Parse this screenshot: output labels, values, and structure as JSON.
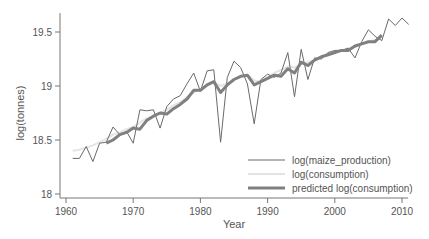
{
  "chart_data": {
    "type": "line",
    "title": "",
    "xlabel": "Year",
    "ylabel": "log(tonnes)",
    "xlim": [
      1959,
      2012
    ],
    "ylim": [
      17.93,
      19.67
    ],
    "x_ticks": [
      1960,
      1970,
      1980,
      1990,
      2000,
      2010
    ],
    "x_tick_labels": [
      "1960",
      "1970",
      "1980",
      "1990",
      "2000",
      "2010"
    ],
    "y_ticks": [
      18,
      18.5,
      19,
      19.5
    ],
    "y_tick_labels": [
      "18",
      "18.5",
      "19",
      "19.5"
    ],
    "grid": false,
    "legend_position": "lower right (inside plot)",
    "series": [
      {
        "name": "log(maize_production)",
        "color": "#6a6a6a",
        "width": 1,
        "x": [
          1961,
          1962,
          1963,
          1964,
          1965,
          1966,
          1967,
          1968,
          1969,
          1970,
          1971,
          1972,
          1973,
          1974,
          1975,
          1976,
          1977,
          1978,
          1979,
          1980,
          1981,
          1982,
          1983,
          1984,
          1985,
          1986,
          1987,
          1988,
          1989,
          1990,
          1991,
          1992,
          1993,
          1994,
          1995,
          1996,
          1997,
          1998,
          1999,
          2000,
          2001,
          2002,
          2003,
          2004,
          2005,
          2006,
          2007,
          2008,
          2009,
          2010,
          2011
        ],
        "values": [
          18.33,
          18.33,
          18.44,
          18.3,
          18.47,
          18.48,
          18.62,
          18.55,
          18.58,
          18.47,
          18.78,
          18.77,
          18.78,
          18.61,
          18.81,
          18.88,
          18.91,
          19.02,
          19.12,
          18.95,
          19.14,
          19.15,
          18.48,
          19.08,
          19.23,
          19.17,
          19.02,
          18.65,
          19.06,
          19.11,
          19.08,
          19.12,
          19.31,
          18.9,
          19.34,
          19.06,
          19.26,
          19.25,
          19.31,
          19.33,
          19.33,
          19.35,
          19.26,
          19.41,
          19.52,
          19.46,
          19.42,
          19.62,
          19.56,
          19.63,
          19.57
        ]
      },
      {
        "name": "log(consumption)",
        "color": "#e4e4e4",
        "width": 2,
        "x": [
          1961,
          1962,
          1963,
          1964,
          1965,
          1966,
          1967,
          1968,
          1969,
          1970,
          1971,
          1972,
          1973,
          1974,
          1975,
          1976,
          1977,
          1978,
          1979,
          1980,
          1981,
          1982,
          1983,
          1984,
          1985,
          1986,
          1987,
          1988,
          1989,
          1990,
          1991,
          1992,
          1993,
          1994,
          1995,
          1996,
          1997,
          1998,
          1999,
          2000,
          2001,
          2002,
          2003,
          2004,
          2005,
          2006,
          2007
        ],
        "values": [
          18.4,
          18.41,
          18.43,
          18.45,
          18.48,
          18.51,
          18.55,
          18.57,
          18.6,
          18.62,
          18.66,
          18.7,
          18.72,
          18.75,
          18.78,
          18.82,
          18.85,
          18.9,
          18.94,
          18.97,
          19.0,
          19.04,
          19.0,
          19.02,
          19.06,
          19.09,
          19.1,
          19.05,
          19.04,
          19.08,
          19.12,
          19.15,
          19.18,
          19.17,
          19.2,
          19.22,
          19.24,
          19.27,
          19.29,
          19.31,
          19.33,
          19.35,
          19.36,
          19.39,
          19.41,
          19.43,
          19.45
        ]
      },
      {
        "name": "predicted log(consumption)",
        "color": "#808080",
        "width": 3,
        "x": [
          1966,
          1967,
          1968,
          1969,
          1970,
          1971,
          1972,
          1973,
          1974,
          1975,
          1976,
          1977,
          1978,
          1979,
          1980,
          1981,
          1982,
          1983,
          1984,
          1985,
          1986,
          1987,
          1988,
          1989,
          1990,
          1991,
          1992,
          1993,
          1994,
          1995,
          1996,
          1997,
          1998,
          1999,
          2000,
          2001,
          2002,
          2003,
          2004,
          2005,
          2006,
          2007
        ],
        "values": [
          18.47,
          18.5,
          18.55,
          18.57,
          18.61,
          18.6,
          18.68,
          18.72,
          18.75,
          18.74,
          18.79,
          18.83,
          18.88,
          18.96,
          18.96,
          19.01,
          19.04,
          18.94,
          19.01,
          19.06,
          19.09,
          19.1,
          19.01,
          19.04,
          19.07,
          19.1,
          19.09,
          19.16,
          19.12,
          19.22,
          19.19,
          19.24,
          19.27,
          19.29,
          19.31,
          19.33,
          19.33,
          19.37,
          19.39,
          19.41,
          19.41,
          19.47
        ]
      }
    ]
  },
  "axes": {
    "x_title": "Year",
    "y_title": "log(tonnes)",
    "x_tick_labels": [
      "1960",
      "1970",
      "1980",
      "1990",
      "2000",
      "2010"
    ],
    "y_tick_labels": [
      "18",
      "18.5",
      "19",
      "19.5"
    ]
  },
  "legend": {
    "items": [
      {
        "label": "log(maize_production)",
        "color": "#6a6a6a",
        "width": 1
      },
      {
        "label": "log(consumption)",
        "color": "#e4e4e4",
        "width": 2
      },
      {
        "label": "predicted log(consumption)",
        "color": "#808080",
        "width": 3
      }
    ]
  }
}
